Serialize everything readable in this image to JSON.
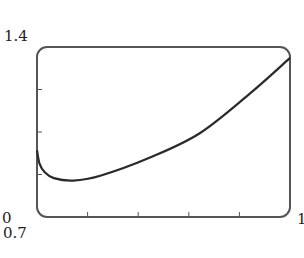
{
  "chart_data": {
    "type": "line",
    "title": "",
    "xlabel": "",
    "ylabel": "",
    "xlim": [
      0.7,
      1
    ],
    "ylim": [
      0,
      1.4
    ],
    "grid": false,
    "legend": null,
    "tick_labels": {
      "y_top": "1.4",
      "y_bottom": "0",
      "x_left": "0.7",
      "x_right": "1"
    },
    "x_ticks": [
      0.76,
      0.82,
      0.88,
      0.94
    ],
    "y_ticks": [
      0.35,
      0.7,
      1.05
    ],
    "series": [
      {
        "name": "curve",
        "x": [
          0.7,
          0.703,
          0.709,
          0.72,
          0.743,
          0.775,
          0.834,
          0.893,
          0.953,
          1.0
        ],
        "y": [
          0.55,
          0.44,
          0.37,
          0.32,
          0.3,
          0.34,
          0.49,
          0.69,
          1.02,
          1.31
        ]
      }
    ]
  },
  "colors": {
    "frame": "#555555",
    "curve": "#2a2a2a"
  }
}
